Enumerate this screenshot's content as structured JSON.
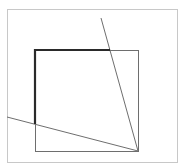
{
  "diagram": {
    "width": 185,
    "height": 166,
    "colors": {
      "background": "#ffffff",
      "frame": "#c8c8c8",
      "thin_line": "#6e6e6e",
      "bold_line": "#2a2a2a"
    },
    "frame": {
      "x": 7,
      "y": 9,
      "w": 170,
      "h": 153
    },
    "square": {
      "x": 35,
      "y": 50,
      "w": 103,
      "h": 101
    },
    "bold_path": [
      [
        35,
        124
      ],
      [
        35,
        50
      ],
      [
        110,
        50
      ]
    ],
    "lines": [
      {
        "name": "steep-line",
        "x1": 101,
        "y1": 18,
        "x2": 138,
        "y2": 151
      },
      {
        "name": "shallow-line",
        "x1": 7,
        "y1": 117,
        "x2": 138,
        "y2": 151
      }
    ]
  }
}
